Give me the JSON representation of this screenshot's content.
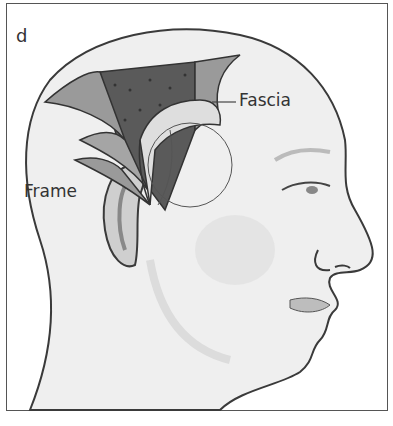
{
  "figure": {
    "panel_letter": "d",
    "labels": {
      "fascia": "Fascia",
      "frame": "Frame"
    },
    "colors": {
      "border": "#555555",
      "skin": "#efefef",
      "outline": "#3a3a3a",
      "muscle_dark": "#5a5a5a",
      "flap_mid": "#9a9a9a",
      "fascia_light": "#dedede",
      "label_text": "#333333"
    }
  }
}
